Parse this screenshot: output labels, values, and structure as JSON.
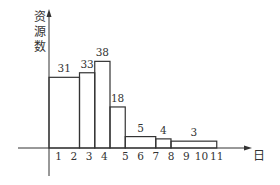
{
  "chart_data": {
    "type": "bar",
    "title": "",
    "xlabel": "日",
    "ylabel": "资源数",
    "x_ticks": [
      "1",
      "2",
      "3",
      "4",
      "5",
      "6",
      "7",
      "8",
      "9",
      "10",
      "11"
    ],
    "series": [
      {
        "name": "资源数",
        "segments": [
          {
            "start_day": 0,
            "end_day": 2,
            "value": 31
          },
          {
            "start_day": 2,
            "end_day": 3,
            "value": 33
          },
          {
            "start_day": 3,
            "end_day": 4,
            "value": 38
          },
          {
            "start_day": 4,
            "end_day": 5,
            "value": 18
          },
          {
            "start_day": 5,
            "end_day": 7,
            "value": 5
          },
          {
            "start_day": 7,
            "end_day": 8,
            "value": 4
          },
          {
            "start_day": 8,
            "end_day": 11,
            "value": 3
          }
        ]
      }
    ],
    "categories": [
      "0-2",
      "2-3",
      "3-4",
      "4-5",
      "5-7",
      "7-8",
      "8-11"
    ],
    "values": [
      31,
      33,
      38,
      18,
      5,
      4,
      3
    ],
    "xlim": [
      0,
      12
    ],
    "ylim": [
      0,
      42
    ],
    "grid": false,
    "legend": "none"
  },
  "labels": {
    "y_axis": "资源数",
    "x_axis": "日",
    "y_axis_chars": [
      "资",
      "源",
      "数"
    ]
  },
  "colors": {
    "stroke": "#333333",
    "background": "#ffffff"
  }
}
